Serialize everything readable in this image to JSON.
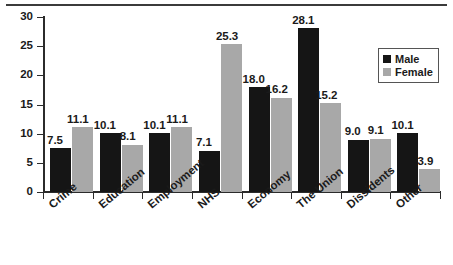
{
  "chart_data": {
    "type": "bar",
    "title": "",
    "subtitle": "",
    "xlabel": "",
    "ylabel": "",
    "categories": [
      "Crime",
      "Education",
      "Employment",
      "NHS",
      "Economy",
      "The Union",
      "Dissidents",
      "Other"
    ],
    "series": [
      {
        "name": "Male",
        "color": "#151515",
        "values": [
          7.5,
          10.1,
          10.1,
          7.1,
          18.0,
          28.1,
          9.0,
          10.1
        ]
      },
      {
        "name": "Female",
        "color": "#a8a8a8",
        "values": [
          11.1,
          8.1,
          11.1,
          25.3,
          16.2,
          15.2,
          9.1,
          3.9
        ]
      }
    ],
    "value_labels": {
      "Male": [
        "7.5",
        "10.1",
        "10.1",
        "7.1",
        "18.0",
        "28.1",
        "9.0",
        "10.1"
      ],
      "Female": [
        "11.1",
        "8.1",
        "11.1",
        "25.3",
        "16.2",
        "15.2",
        "9.1",
        "3.9"
      ]
    },
    "ylim": [
      0,
      30
    ],
    "yticks": [
      0,
      5,
      10,
      15,
      20,
      25,
      30
    ],
    "ytick_labels": [
      "0",
      "5",
      "10",
      "15",
      "20",
      "25",
      "30"
    ],
    "grid": false,
    "legend_position": "upper-right",
    "legend_entries": [
      "Male",
      "Female"
    ],
    "bar_value_labels_shown": true
  },
  "colors": {
    "male": "#151515",
    "female": "#a8a8a8",
    "axis": "#2b2b2b",
    "rule": "#3b3b3b",
    "text": "#1a1a1a",
    "background": "#ffffff"
  }
}
